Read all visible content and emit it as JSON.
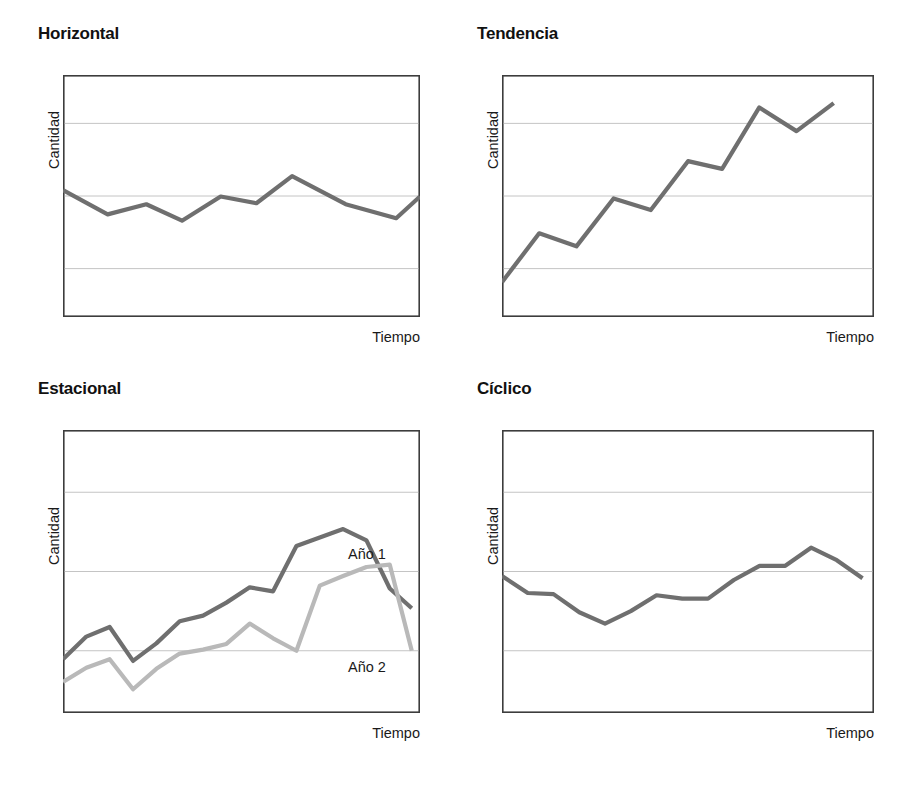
{
  "figure": {
    "axis_labels": {
      "x": "Tiempo",
      "y": "Cantidad"
    },
    "colors": {
      "series_main": "#6f6f6f",
      "series_alt": "#b9b9b9",
      "frame": "#3d3d3d",
      "gridline": "#bdbdbd",
      "background": "#ffffff",
      "text": "#1a1a1a"
    }
  },
  "panels": [
    {
      "id": "horizontal",
      "title": "Horizontal",
      "xlabel": "Tiempo",
      "ylabel": "Cantidad",
      "chart_data": {
        "type": "line",
        "title": "Horizontal",
        "xlabel": "Tiempo",
        "ylabel": "Cantidad",
        "xlim": [
          0,
          12
        ],
        "ylim": [
          0,
          5
        ],
        "grid": true,
        "gridlines_y": [
          1,
          2.5,
          4
        ],
        "x": [
          0,
          1.5,
          2.8,
          4,
          5.3,
          6.5,
          7.7,
          9.5,
          11.2,
          12
        ],
        "series": [
          {
            "name": "serie",
            "values": [
              2.62,
              2.12,
              2.33,
              1.99,
              2.49,
              2.35,
              2.91,
              2.33,
              2.04,
              2.49
            ]
          }
        ]
      }
    },
    {
      "id": "tendencia",
      "title": "Tendencia",
      "xlabel": "Tiempo",
      "ylabel": "Cantidad",
      "chart_data": {
        "type": "line",
        "title": "Tendencia",
        "xlabel": "Tiempo",
        "ylabel": "Cantidad",
        "xlim": [
          0,
          12
        ],
        "ylim": [
          0,
          5
        ],
        "grid": true,
        "gridlines_y": [
          1,
          2.5,
          4
        ],
        "x": [
          0,
          1.2,
          2.4,
          3.6,
          4.8,
          6,
          7.1,
          8.3,
          9.5,
          10.7
        ],
        "series": [
          {
            "name": "serie",
            "values": [
              0.72,
              1.73,
              1.46,
              2.45,
              2.21,
              3.22,
              3.06,
              4.33,
              3.84,
              4.42
            ]
          }
        ]
      }
    },
    {
      "id": "estacional",
      "title": "Estacional",
      "xlabel": "Tiempo",
      "ylabel": "Cantidad",
      "annotations": [
        {
          "text": "Año 1",
          "series": "Año 1"
        },
        {
          "text": "Año 2",
          "series": "Año 2"
        }
      ],
      "chart_data": {
        "type": "line",
        "title": "Estacional",
        "xlabel": "Tiempo",
        "ylabel": "Cantidad",
        "xlim": [
          0,
          13
        ],
        "ylim": [
          0,
          5
        ],
        "grid": true,
        "gridlines_y": [
          1.1,
          2.5,
          3.9
        ],
        "x": [
          0,
          0.85,
          1.7,
          2.55,
          3.4,
          4.25,
          5.1,
          5.95,
          6.8,
          7.65,
          8.5,
          9.35,
          10.2,
          11.05,
          11.9,
          12.7
        ],
        "series": [
          {
            "name": "Año 1",
            "values": [
              0.95,
              1.35,
              1.52,
              0.92,
              1.23,
              1.62,
              1.72,
              1.95,
              2.22,
              2.15,
              2.95,
              3.1,
              3.25,
              3.05,
              2.2,
              1.85
            ]
          },
          {
            "name": "Año 2",
            "values": [
              0.55,
              0.8,
              0.95,
              0.42,
              0.78,
              1.05,
              1.12,
              1.22,
              1.58,
              1.32,
              1.1,
              2.25,
              2.42,
              2.58,
              2.62,
              1.1
            ]
          }
        ]
      }
    },
    {
      "id": "ciclico",
      "title": "Cíclico",
      "xlabel": "Tiempo",
      "ylabel": "Cantidad",
      "chart_data": {
        "type": "line",
        "title": "Cíclico",
        "xlabel": "Tiempo",
        "ylabel": "Cantidad",
        "xlim": [
          0,
          13
        ],
        "ylim": [
          0,
          5
        ],
        "grid": true,
        "gridlines_y": [
          1.1,
          2.5,
          3.9
        ],
        "x": [
          0,
          0.9,
          1.8,
          2.7,
          3.6,
          4.5,
          5.4,
          6.3,
          7.2,
          8.1,
          9.0,
          9.9,
          10.8,
          11.7,
          12.6
        ],
        "series": [
          {
            "name": "serie",
            "values": [
              2.42,
              2.12,
              2.1,
              1.78,
              1.58,
              1.8,
              2.08,
              2.02,
              2.02,
              2.35,
              2.6,
              2.6,
              2.92,
              2.7,
              2.38
            ]
          }
        ]
      }
    }
  ]
}
